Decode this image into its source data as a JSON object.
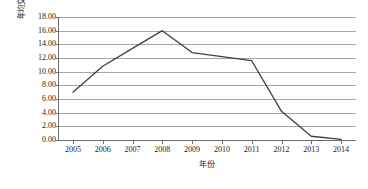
{
  "chart_data": {
    "type": "line",
    "title": "",
    "xlabel": "年份",
    "ylabel": "年均交易价格/美元",
    "categories": [
      "2005",
      "2006",
      "2007",
      "2008",
      "2009",
      "2010",
      "2011",
      "2012",
      "2013",
      "2014"
    ],
    "x": [
      2005,
      2006,
      2007,
      2008,
      2009,
      2010,
      2011,
      2012,
      2013,
      2014
    ],
    "series": [
      {
        "name": "年均交易价格",
        "values": [
          7.0,
          10.8,
          13.4,
          16.0,
          12.8,
          12.2,
          11.6,
          4.2,
          0.55,
          0.1
        ]
      }
    ],
    "ylim": [
      0,
      18
    ],
    "ytick_labels": [
      "0.00",
      "2.00",
      "4.00",
      "6.00",
      "8.00",
      "10.00",
      "12.00",
      "14.00",
      "16.00",
      "18.00"
    ],
    "ytick_values": [
      0,
      2,
      4,
      6,
      8,
      10,
      12,
      14,
      16,
      18
    ],
    "grid": true,
    "legend": false,
    "line_color": "#3f3f3f"
  },
  "colors": {
    "line": "#3f3f3f",
    "gridline": "#a6a6a6",
    "axis": "#6e6e6e",
    "text": "#1a1a1a",
    "background": "#ffffff"
  }
}
